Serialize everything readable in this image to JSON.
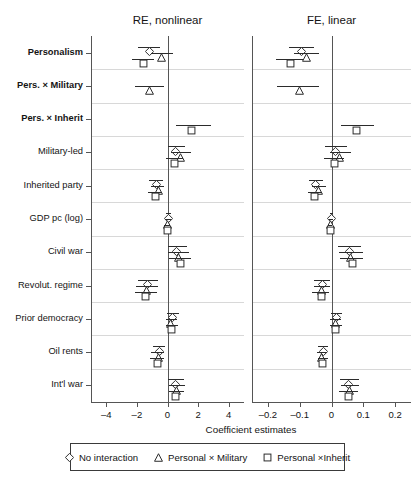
{
  "chart_data": {
    "type": "scatter",
    "subtype": "coefficient-plot-forest",
    "title": "",
    "xlabel": "Coefficient estimates",
    "ylabel": "",
    "grid": true,
    "legend_position": "bottom",
    "categories": [
      "Personalism",
      "Pers. × Military",
      "Pers. × Inherit",
      "Military-led",
      "Inherited party",
      "GDP pc (log)",
      "Civil war",
      "Revolut. regime",
      "Prior democracy",
      "Oil rents",
      "Int'l war"
    ],
    "category_bold": [
      true,
      true,
      true,
      false,
      false,
      false,
      false,
      false,
      false,
      false,
      false
    ],
    "series_names": [
      "No interaction",
      "Personal × Military",
      "Personal ×Inherit"
    ],
    "series_markers": [
      "diamond",
      "triangle",
      "square"
    ],
    "panels": [
      {
        "title": "RE, nonlinear",
        "xlim": [
          -5.0,
          5.0
        ],
        "xticks": [
          -4,
          -2,
          0,
          2,
          4
        ],
        "xticklabels": [
          "–4",
          "–2",
          "0",
          "2",
          "4"
        ],
        "series": [
          {
            "name": "No interaction",
            "marker": "diamond",
            "values": [
              -1.2,
              null,
              null,
              0.55,
              -0.75,
              0.05,
              0.62,
              -1.3,
              0.3,
              -0.55,
              0.55
            ],
            "ci_low": [
              -1.95,
              null,
              null,
              0.05,
              -1.2,
              -0.12,
              0.05,
              -1.95,
              -0.05,
              -0.95,
              0.05
            ],
            "ci_high": [
              -0.5,
              null,
              null,
              1.15,
              -0.32,
              0.22,
              1.3,
              -0.62,
              0.72,
              -0.15,
              1.1
            ]
          },
          {
            "name": "Personal × Military",
            "marker": "triangle",
            "values": [
              -0.4,
              -1.15,
              null,
              0.85,
              -0.62,
              0.02,
              0.7,
              -1.35,
              0.22,
              -0.62,
              0.62
            ],
            "ci_low": [
              -1.1,
              -2.1,
              null,
              0.22,
              -1.05,
              -0.15,
              0.05,
              -2.05,
              -0.12,
              -1.05,
              0.12
            ],
            "ci_high": [
              0.35,
              -0.2,
              null,
              1.55,
              -0.22,
              0.2,
              1.4,
              -0.65,
              0.62,
              -0.22,
              1.15
            ]
          },
          {
            "name": "Personal ×Inherit",
            "marker": "square",
            "values": [
              -1.6,
              null,
              1.55,
              0.45,
              -0.8,
              -0.02,
              0.85,
              -1.45,
              0.28,
              -0.65,
              0.55
            ],
            "ci_low": [
              -2.35,
              null,
              0.55,
              -0.12,
              -1.3,
              -0.2,
              0.12,
              -2.15,
              -0.1,
              -1.12,
              0.1
            ],
            "ci_high": [
              -0.85,
              null,
              2.85,
              1.02,
              -0.35,
              0.16,
              1.55,
              -0.7,
              0.7,
              -0.22,
              1.05
            ]
          }
        ]
      },
      {
        "title": "FE, linear",
        "xlim": [
          -0.25,
          0.25
        ],
        "xticks": [
          -0.2,
          -0.1,
          0,
          0.1,
          0.2
        ],
        "xticklabels": [
          "–0.2",
          "–0.1",
          "0",
          "0.1",
          "0.2"
        ],
        "series": [
          {
            "name": "No interaction",
            "marker": "diamond",
            "values": [
              -0.095,
              null,
              null,
              0.012,
              -0.05,
              0.0,
              0.058,
              -0.028,
              0.015,
              -0.026,
              0.055
            ],
            "ci_low": [
              -0.135,
              null,
              null,
              -0.02,
              -0.072,
              -0.006,
              0.022,
              -0.054,
              -0.003,
              -0.042,
              0.028
            ],
            "ci_high": [
              -0.055,
              null,
              null,
              0.048,
              -0.028,
              0.006,
              0.092,
              -0.004,
              0.034,
              -0.01,
              0.086
            ]
          },
          {
            "name": "Personal × Military",
            "marker": "triangle",
            "values": [
              -0.08,
              -0.1,
              null,
              0.024,
              -0.04,
              -0.002,
              0.06,
              -0.03,
              0.012,
              -0.03,
              0.058
            ],
            "ci_low": [
              -0.118,
              -0.17,
              null,
              -0.004,
              -0.062,
              -0.008,
              0.024,
              -0.056,
              -0.006,
              -0.046,
              0.03
            ],
            "ci_high": [
              -0.038,
              -0.038,
              null,
              0.062,
              -0.018,
              0.005,
              0.098,
              -0.006,
              0.03,
              -0.014,
              0.088
            ]
          },
          {
            "name": "Personal ×Inherit",
            "marker": "square",
            "values": [
              -0.13,
              null,
              0.08,
              0.01,
              -0.052,
              -0.004,
              0.065,
              -0.032,
              0.014,
              -0.028,
              0.052
            ],
            "ci_low": [
              -0.175,
              null,
              0.03,
              -0.024,
              -0.075,
              -0.01,
              0.026,
              -0.06,
              -0.004,
              -0.044,
              0.024
            ],
            "ci_high": [
              -0.09,
              null,
              0.134,
              0.04,
              -0.03,
              0.003,
              0.1,
              -0.008,
              0.032,
              -0.012,
              0.082
            ]
          }
        ]
      }
    ]
  },
  "legend": {
    "items": [
      {
        "marker": "diamond",
        "label": "No interaction"
      },
      {
        "marker": "triangle",
        "label": "Personal × Military"
      },
      {
        "marker": "square",
        "label": "Personal ×Inherit"
      }
    ]
  },
  "colors": {
    "marker_stroke": "#2b2b2b",
    "ci_line": "#2b2b2b",
    "grid": "#d8d8d8",
    "axis": "#555555",
    "text": "#141414",
    "background": "#ffffff"
  }
}
